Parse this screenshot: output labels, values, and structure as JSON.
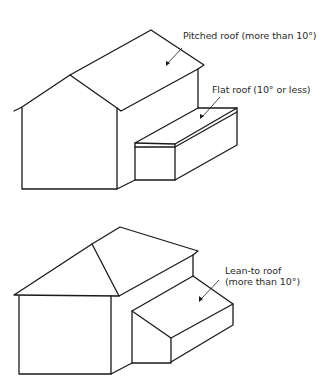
{
  "diagrams": [
    {
      "id": "top",
      "description": "Gable-ended house with pitched roof and flat-roofed extension",
      "labels": [
        {
          "key": "pitched",
          "text": "Pitched roof (more than 10°)"
        },
        {
          "key": "flat",
          "text": "Flat roof (10° or less)"
        }
      ]
    },
    {
      "id": "bottom",
      "description": "Hipped-roof house with lean-to roof extension",
      "labels": [
        {
          "key": "leanto_line1",
          "text": "Lean-to roof"
        },
        {
          "key": "leanto_line2",
          "text": "(more than 10°)"
        }
      ]
    }
  ],
  "colors": {
    "line": "#1a1a1a",
    "text": "#2a2a2a",
    "background": "#ffffff"
  }
}
